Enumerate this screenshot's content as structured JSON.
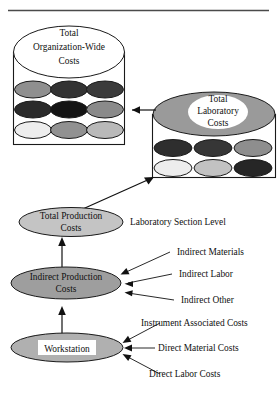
{
  "figure": {
    "title_rule": "horizontal-rule",
    "colors": {
      "outline": "#1a1a1a",
      "white": "#ffffff",
      "gray_mid": "#999999",
      "gray_light": "#d9d9d9",
      "gray_lighter": "#ebebeb",
      "gray_dark": "#3a3a3a",
      "gray_darker": "#222222",
      "black": "#111111"
    }
  },
  "org_box": {
    "name": "organization-wide-costs-container",
    "header_ellipse": {
      "label_line1": "Total",
      "label_line2": "Organization-Wide",
      "label_line3": "Costs",
      "fill": "#ffffff"
    },
    "ellipse_grid": {
      "rows": 3,
      "cols": 3,
      "fills": [
        [
          "#8f8f8f",
          "#333333",
          "#3b3b3b"
        ],
        [
          "#2b2b2b",
          "#141414",
          "#8a8a8a"
        ],
        [
          "#ededed",
          "#919191",
          "#b9b9b9"
        ]
      ]
    }
  },
  "lab_box": {
    "name": "laboratory-costs-container",
    "header_ellipse": {
      "outer_fill": "#9a9a9a",
      "inner_fill": "#ffffff",
      "label_line1": "Total",
      "label_line2": "Laboratory",
      "label_line3": "Costs"
    },
    "ellipse_grid": {
      "rows": 2,
      "cols": 3,
      "fills": [
        [
          "#2e2e2e",
          "#363636",
          "#8e8e8e"
        ],
        [
          "#ededed",
          "#c2c2c2",
          "#262626"
        ]
      ]
    }
  },
  "nodes": {
    "total_production": {
      "label_line1": "Total Production",
      "label_line2": "Costs",
      "fill": "#c4c4c4"
    },
    "indirect_production": {
      "label_line1": "Indirect Production",
      "label_line2": "Costs",
      "fill": "#9e9e9e"
    },
    "workstation": {
      "label": "Workstation",
      "fill": "#b0b0b0",
      "label_bg": "#ffffff"
    }
  },
  "annotations": {
    "section_level": "Laboratory Section Level",
    "indirect": [
      "Indirect Materials",
      "Indirect Labor",
      "Indirect Other"
    ],
    "direct": [
      "Instrument Associated Costs",
      "Direct Material Costs",
      "Direct Labor Costs"
    ]
  }
}
